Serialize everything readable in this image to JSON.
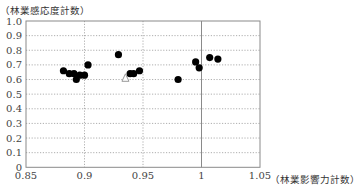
{
  "chart_data": {
    "type": "scatter",
    "title": "",
    "xlabel": "（林業影響力計数）",
    "ylabel": "（林業感応度計数）",
    "xlim": [
      0.85,
      1.05
    ],
    "ylim": [
      0,
      1.0
    ],
    "x_ticks": [
      "0.85",
      "0.9",
      "0.95",
      "1",
      "1.05"
    ],
    "y_ticks": [
      "0",
      "0.1",
      "0.2",
      "0.3",
      "0.4",
      "0.5",
      "0.6",
      "0.7",
      "0.8",
      "0.9",
      "1.0"
    ],
    "grid": {
      "horizontal": "dotted",
      "vertical": "dotted",
      "reference_line_x": 1.0
    },
    "legend": null,
    "series": [
      {
        "name": "circles",
        "marker": "filled-circle",
        "color": "#000000",
        "points": [
          {
            "x": 0.882,
            "y": 0.66
          },
          {
            "x": 0.887,
            "y": 0.64
          },
          {
            "x": 0.891,
            "y": 0.64
          },
          {
            "x": 0.893,
            "y": 0.6
          },
          {
            "x": 0.896,
            "y": 0.63
          },
          {
            "x": 0.9,
            "y": 0.63
          },
          {
            "x": 0.903,
            "y": 0.7
          },
          {
            "x": 0.929,
            "y": 0.77
          },
          {
            "x": 0.939,
            "y": 0.64
          },
          {
            "x": 0.942,
            "y": 0.64
          },
          {
            "x": 0.947,
            "y": 0.66
          },
          {
            "x": 0.98,
            "y": 0.6
          },
          {
            "x": 0.995,
            "y": 0.72
          },
          {
            "x": 0.998,
            "y": 0.68
          },
          {
            "x": 1.007,
            "y": 0.75
          },
          {
            "x": 1.014,
            "y": 0.74
          }
        ]
      },
      {
        "name": "triangle",
        "marker": "open-triangle",
        "color": "#999999",
        "points": [
          {
            "x": 0.935,
            "y": 0.61
          }
        ]
      }
    ]
  },
  "labels": {
    "ylabel": "（林業感応度計数）",
    "xlabel": "（林業影響力計数）"
  }
}
